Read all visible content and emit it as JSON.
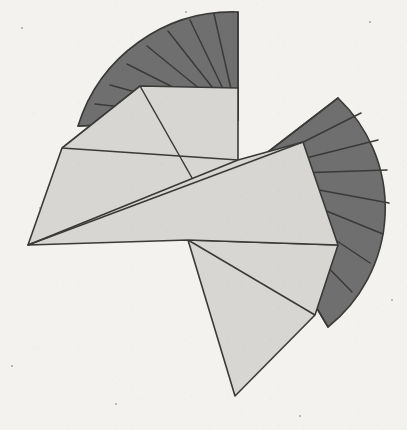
{
  "figure": {
    "kind": "geometric-diagram",
    "canvas": {
      "width": 407,
      "height": 430
    },
    "background_color": "#f3f2ef",
    "palette": {
      "dark_sector_fill": "#6f6f6f",
      "light_flap_fill": "#d7d6d2",
      "stroke": "#3a3a38",
      "background": "#f3f2ef"
    },
    "stroke_width": 1.6,
    "shapes": [
      {
        "name": "upper-left-dark-fan",
        "fill": "#6f6f6f",
        "ribs": 9,
        "pivot": [
          238,
          120
        ],
        "sweep_start_deg": 180,
        "sweep_end_deg": 270,
        "radius": 160
      },
      {
        "name": "right-dark-fan",
        "fill": "#6f6f6f",
        "ribs": 9,
        "pivot": [
          238,
          175
        ],
        "sweep_start_deg": -50,
        "sweep_end_deg": 56,
        "radius": 150
      },
      {
        "name": "upper-light-flap",
        "fill": "#d7d6d2"
      },
      {
        "name": "central-light-flap",
        "fill": "#d7d6d2"
      },
      {
        "name": "lower-light-flap",
        "fill": "#d7d6d2"
      }
    ],
    "geometry": {
      "upper_fan_outline": "M 238 12 L 238 120 L 78 126 A 162 162 0 0 1 238 12 Z",
      "upper_fan_ribs": [
        "M 238 120 L 238 12",
        "M 238 120 L 214 14",
        "M 238 120 L 190 20",
        "M 238 120 L 168 31",
        "M 238 120 L 147 46",
        "M 238 120 L 127 64",
        "M 238 120 L 110 85",
        "M 238 120 L 95 104",
        "M 238 120 L 78 126"
      ],
      "right_fan_outline": "M 338 98 A 152 152 0 0 1 328 327 L 238 175 Z",
      "right_fan_ribs": [
        "M 238 175 L 338 98",
        "M 238 175 L 361 113",
        "M 238 175 L 378 140",
        "M 238 175 L 387 170",
        "M 238 175 L 389 203",
        "M 238 175 L 383 234",
        "M 238 175 L 370 263",
        "M 238 175 L 352 292",
        "M 238 175 L 328 327"
      ],
      "upper_light_flap": "M 140 86 L 238 88 L 238 160 L 196 185 L 28 245 L 62 148 Z",
      "upper_light_flap_creases": [
        "M 140 86 L 196 185",
        "M 62 148 L 238 160"
      ],
      "central_light_flap": "M 303 142 L 338 245 L 188 240 L 28 245 L 238 160 Z",
      "central_light_flap_creases": [
        "M 28 245 L 303 142"
      ],
      "lower_light_flap": "M 188 240 L 338 245 L 315 315 L 235 396 Z",
      "lower_light_flap_creases": [
        "M 188 240 L 315 315"
      ]
    },
    "specks": [
      {
        "x": 22,
        "y": 28,
        "r": 1.4
      },
      {
        "x": 186,
        "y": 12,
        "r": 1.0
      },
      {
        "x": 370,
        "y": 22,
        "r": 1.2
      },
      {
        "x": 40,
        "y": 208,
        "r": 1.0
      },
      {
        "x": 392,
        "y": 300,
        "r": 1.1
      },
      {
        "x": 116,
        "y": 404,
        "r": 1.2
      },
      {
        "x": 300,
        "y": 416,
        "r": 1.0
      },
      {
        "x": 12,
        "y": 366,
        "r": 1.1
      }
    ]
  }
}
